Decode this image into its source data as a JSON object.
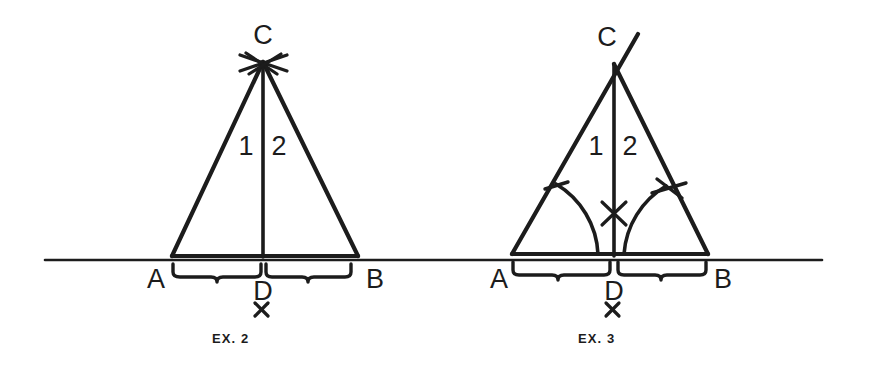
{
  "figure": {
    "background_color": "#ffffff",
    "ink_color": "#1c1c1c",
    "width": 871,
    "height": 370,
    "baseline": {
      "x1": 45,
      "x2": 822,
      "y": 260
    }
  },
  "panels": [
    {
      "id": "ex2",
      "caption": "EX. 2",
      "description": "Isosceles triangle ACB with altitude CD to base AB; construction arcs cross at apex C; base divided into two equal parts AD and DB marked by braces; point D marked with an x.",
      "points": {
        "A": {
          "label": "A",
          "x": 172,
          "y": 256,
          "label_x": 147,
          "label_y": 288
        },
        "B": {
          "label": "B",
          "x": 358,
          "y": 256,
          "label_x": 366,
          "label_y": 288
        },
        "C": {
          "label": "C",
          "x": 263,
          "y": 62,
          "label_x": 251,
          "label_y": 40
        },
        "D": {
          "label": "D",
          "x": 263,
          "y": 256,
          "label_x": 253,
          "label_y": 298
        }
      },
      "angle_labels": [
        {
          "label": "1",
          "x": 242,
          "y": 145
        },
        {
          "label": "2",
          "x": 271,
          "y": 145
        }
      ],
      "x_marks": [
        {
          "label": "x",
          "x": 257,
          "y": 319,
          "name": "d-foot-x-mark"
        }
      ],
      "apex_cross": {
        "x": 263,
        "y": 62,
        "arms": 4
      },
      "braces": [
        {
          "name": "brace-ad",
          "x1": 172,
          "x2": 263,
          "y": 268
        },
        {
          "name": "brace-db",
          "x1": 263,
          "x2": 358,
          "y": 268
        }
      ],
      "arcs": [],
      "tick_marks": []
    },
    {
      "id": "ex3",
      "caption": "EX. 3",
      "description": "Isosceles triangle ACB with angle bisector CD; arcs swung from A and B meet the legs with tick and cross marks; the bisector carries an x crossing mark; base divided into equal parts AD and DB marked by braces; point D marked with an x.",
      "points": {
        "A": {
          "label": "A",
          "x": 512,
          "y": 254,
          "label_x": 490,
          "label_y": 288
        },
        "B": {
          "label": "B",
          "x": 708,
          "y": 254,
          "label_x": 714,
          "label_y": 288
        },
        "C": {
          "label": "C",
          "x": 614,
          "y": 62,
          "label_x": 597,
          "label_y": 42
        },
        "D": {
          "label": "D",
          "x": 614,
          "y": 254,
          "label_x": 604,
          "label_y": 298
        }
      },
      "angle_labels": [
        {
          "label": "1",
          "x": 592,
          "y": 145
        },
        {
          "label": "2",
          "x": 623,
          "y": 145
        }
      ],
      "x_marks": [
        {
          "label": "x",
          "x": 608,
          "y": 319,
          "name": "d-foot-x-mark"
        }
      ],
      "apex_overshoot": {
        "x1": 614,
        "y1": 62,
        "x2": 638,
        "y2": 34
      },
      "bisector_cross": {
        "x": 614,
        "y": 213
      },
      "braces": [
        {
          "name": "brace-ad",
          "x1": 512,
          "x2": 610,
          "y": 266
        },
        {
          "name": "brace-db",
          "x1": 618,
          "x2": 708,
          "y": 266
        }
      ],
      "arcs": [
        {
          "name": "arc-from-a",
          "cx": 512,
          "cy": 254,
          "r": 86
        },
        {
          "name": "arc-from-b",
          "cx": 708,
          "cy": 254,
          "r": 86
        }
      ],
      "tick_marks": [
        {
          "name": "tick-on-left-leg",
          "x": 556,
          "y": 188
        },
        {
          "name": "cross-on-right-leg",
          "x": 667,
          "y": 190
        }
      ]
    }
  ]
}
